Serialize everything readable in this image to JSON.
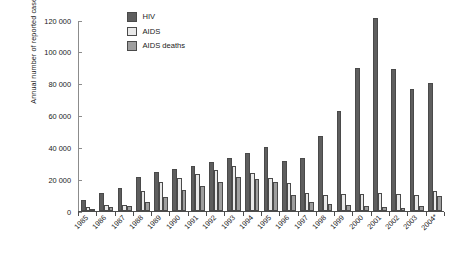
{
  "chart_data": {
    "type": "bar",
    "title": "",
    "xlabel": "",
    "ylabel": "Annual number of reported cases",
    "ylim": [
      0,
      120000
    ],
    "ytick_labels": [
      "120 000",
      "100 000",
      "80 000",
      "60 000",
      "40 000",
      "20 000",
      "0"
    ],
    "ytick_values": [
      120000,
      100000,
      80000,
      60000,
      40000,
      20000,
      0
    ],
    "grid": false,
    "legend_position": "top-left-inside",
    "categories": [
      "1985",
      "1986",
      "1987",
      "1988",
      "1989",
      "1990",
      "1991",
      "1992",
      "1993",
      "1994",
      "1995",
      "1996",
      "1997",
      "1998",
      "1999",
      "2000",
      "2001",
      "2002",
      "2003",
      "2004*"
    ],
    "series": [
      {
        "name": "HIV",
        "color": "#5e5e5e",
        "values": [
          7000,
          11500,
          14500,
          21500,
          24500,
          26500,
          28500,
          30500,
          33500,
          36500,
          40500,
          31500,
          33500,
          47000,
          63000,
          90000,
          121000,
          89000,
          76500,
          80500
        ]
      },
      {
        "name": "AIDS",
        "color": "#e9e9e9",
        "values": [
          2500,
          4000,
          3500,
          12500,
          18500,
          20500,
          23500,
          25500,
          28500,
          24000,
          20500,
          17500,
          11500,
          10000,
          10500,
          11000,
          11500,
          10500,
          10000,
          12500
        ]
      },
      {
        "name": "AIDS deaths",
        "color": "#9e9e9e",
        "values": [
          1500,
          2500,
          3000,
          5500,
          8500,
          13000,
          16000,
          18500,
          21500,
          20000,
          18000,
          10000,
          5500,
          4500,
          3500,
          3000,
          2500,
          2000,
          3000,
          9500
        ]
      }
    ]
  },
  "legend": {
    "items": [
      {
        "label": "HIV",
        "key": "hiv"
      },
      {
        "label": "AIDS",
        "key": "aids"
      },
      {
        "label": "AIDS deaths",
        "key": "deaths"
      }
    ]
  }
}
